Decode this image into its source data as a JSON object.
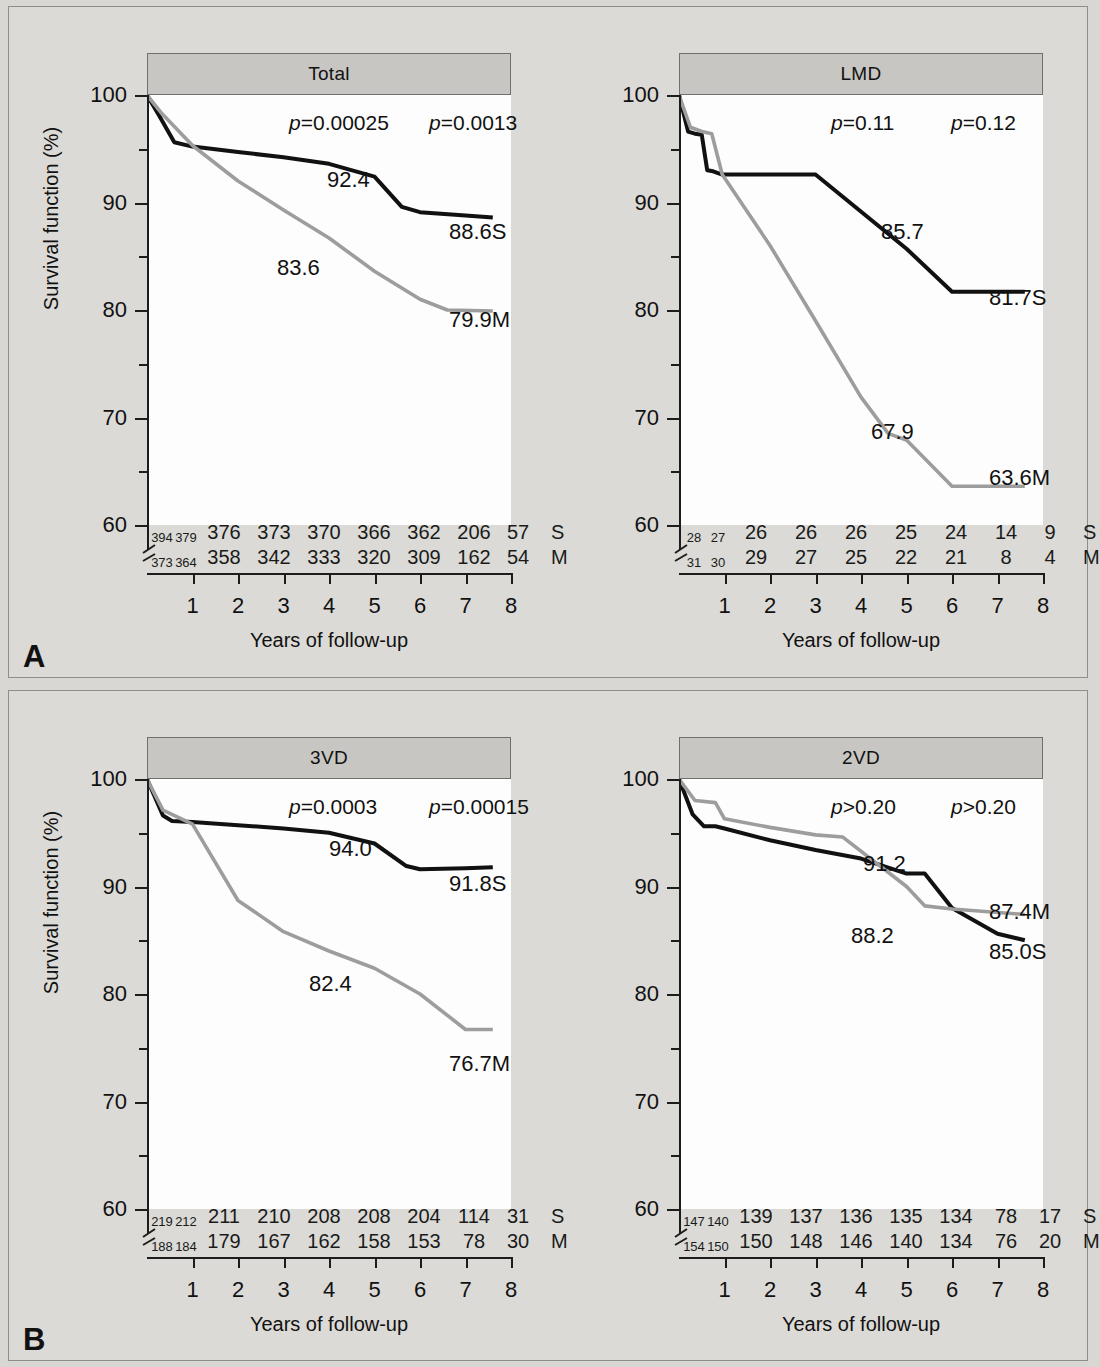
{
  "figure": {
    "panel_a_letter": "A",
    "panel_b_letter": "B",
    "y_title": "Survival function (%)",
    "x_title": "Years of follow-up",
    "y_ticks": [
      "100",
      "90",
      "80",
      "70",
      "60"
    ],
    "x_ticks": [
      "1",
      "2",
      "3",
      "4",
      "5",
      "6",
      "7",
      "8"
    ],
    "risk_tag_s": "S",
    "risk_tag_m": "M",
    "colors": {
      "surgery_line": "#111111",
      "medical_line": "#9d9d9d",
      "plot_background": "#fdfdfd",
      "figure_background": "#dbdad6",
      "header_strip": "#c7c6c2"
    }
  },
  "chart_data": [
    {
      "type": "line",
      "title": "Total",
      "panel": "A",
      "position": "left",
      "xlabel": "Years of follow-up",
      "ylabel": "Survival function (%)",
      "xlim": [
        0,
        8
      ],
      "ylim": [
        60,
        100
      ],
      "grid": false,
      "legend": "inline-end-labels",
      "annotations": {
        "p_left": "p=0.00025",
        "p_right": "p=0.0013",
        "surgery_mid_label": "92.4",
        "medical_mid_label": "83.6",
        "surgery_end_label": "88.6S",
        "medical_end_label": "79.9M"
      },
      "series": [
        {
          "name": "Surgery",
          "code": "S",
          "color": "#111111",
          "x": [
            0,
            0.25,
            0.6,
            1.0,
            2,
            3,
            4,
            5,
            5.6,
            6,
            7,
            7.6
          ],
          "y": [
            100,
            98.2,
            95.6,
            95.2,
            94.7,
            94.2,
            93.6,
            92.4,
            89.6,
            89.1,
            88.8,
            88.6
          ]
        },
        {
          "name": "Medical",
          "code": "M",
          "color": "#9d9d9d",
          "x": [
            0,
            0.3,
            1.0,
            2,
            3,
            4,
            5,
            6,
            6.6,
            7.6
          ],
          "y": [
            100,
            98.4,
            95.3,
            92.0,
            89.3,
            86.7,
            83.6,
            81.0,
            80.0,
            79.9
          ]
        }
      ],
      "risk_table": {
        "columns": [
          "0",
          "0.5",
          "1",
          "2",
          "3",
          "4",
          "5",
          "6",
          "7",
          "tag"
        ],
        "rows": [
          {
            "code": "S",
            "values": [
              "394",
              "379",
              "376",
              "373",
              "370",
              "366",
              "362",
              "206",
              "57"
            ]
          },
          {
            "code": "M",
            "values": [
              "373",
              "364",
              "358",
              "342",
              "333",
              "320",
              "309",
              "162",
              "54"
            ]
          }
        ]
      }
    },
    {
      "type": "line",
      "title": "LMD",
      "panel": "A",
      "position": "right",
      "xlabel": "Years of follow-up",
      "ylabel": "Survival function (%)",
      "xlim": [
        0,
        8
      ],
      "ylim": [
        60,
        100
      ],
      "grid": false,
      "legend": "inline-end-labels",
      "annotations": {
        "p_left": "p=0.11",
        "p_right": "p=0.12",
        "surgery_mid_label": "85.7",
        "medical_mid_label": "67.9",
        "surgery_end_label": "81.7S",
        "medical_end_label": "63.6M"
      },
      "series": [
        {
          "name": "Surgery",
          "code": "S",
          "color": "#111111",
          "x": [
            0,
            0.2,
            0.35,
            0.5,
            0.62,
            0.75,
            0.95,
            3,
            5,
            6,
            7.6
          ],
          "y": [
            100,
            96.6,
            96.4,
            96.3,
            93.0,
            92.9,
            92.6,
            92.6,
            85.7,
            81.7,
            81.7
          ]
        },
        {
          "name": "Medical",
          "code": "M",
          "color": "#9d9d9d",
          "x": [
            0,
            0.25,
            0.5,
            0.72,
            0.95,
            2,
            3,
            4,
            4.6,
            5,
            6,
            7.6
          ],
          "y": [
            100,
            97.0,
            96.6,
            96.4,
            92.6,
            86.0,
            79.0,
            71.9,
            68.5,
            67.9,
            63.6,
            63.6
          ]
        }
      ],
      "risk_table": {
        "columns": [
          "0",
          "0.5",
          "1",
          "2",
          "3",
          "4",
          "5",
          "6",
          "7",
          "tag"
        ],
        "rows": [
          {
            "code": "S",
            "values": [
              "28",
              "27",
              "26",
              "26",
              "26",
              "25",
              "24",
              "14",
              "9"
            ]
          },
          {
            "code": "M",
            "values": [
              "31",
              "30",
              "29",
              "27",
              "25",
              "22",
              "21",
              "8",
              "4"
            ]
          }
        ]
      }
    },
    {
      "type": "line",
      "title": "3VD",
      "panel": "B",
      "position": "left",
      "xlabel": "Years of follow-up",
      "ylabel": "Survival function (%)",
      "xlim": [
        0,
        8
      ],
      "ylim": [
        60,
        100
      ],
      "grid": false,
      "legend": "inline-end-labels",
      "annotations": {
        "p_left": "p=0.0003",
        "p_right": "p=0.00015",
        "surgery_mid_label": "94.0",
        "medical_mid_label": "82.4",
        "surgery_end_label": "91.8S",
        "medical_end_label": "76.7M"
      },
      "series": [
        {
          "name": "Surgery",
          "code": "S",
          "color": "#111111",
          "x": [
            0,
            0.35,
            0.55,
            1.0,
            2,
            3,
            4,
            5,
            5.7,
            6,
            7,
            7.6
          ],
          "y": [
            100,
            96.6,
            96.1,
            96.0,
            95.7,
            95.4,
            95.0,
            94.0,
            91.9,
            91.6,
            91.7,
            91.8
          ]
        },
        {
          "name": "Medical",
          "code": "M",
          "color": "#9d9d9d",
          "x": [
            0,
            0.35,
            1.0,
            2,
            3,
            4,
            5,
            6,
            7,
            7.6
          ],
          "y": [
            100,
            97.1,
            95.8,
            88.7,
            85.8,
            84.0,
            82.4,
            80.0,
            76.7,
            76.7
          ]
        }
      ],
      "risk_table": {
        "columns": [
          "0",
          "0.5",
          "1",
          "2",
          "3",
          "4",
          "5",
          "6",
          "7",
          "tag"
        ],
        "rows": [
          {
            "code": "S",
            "values": [
              "219",
              "212",
              "211",
              "210",
              "208",
              "208",
              "204",
              "114",
              "31"
            ]
          },
          {
            "code": "M",
            "values": [
              "188",
              "184",
              "179",
              "167",
              "162",
              "158",
              "153",
              "78",
              "30"
            ]
          }
        ]
      }
    },
    {
      "type": "line",
      "title": "2VD",
      "panel": "B",
      "position": "right",
      "xlabel": "Years of follow-up",
      "ylabel": "Survival function (%)",
      "xlim": [
        0,
        8
      ],
      "ylim": [
        60,
        100
      ],
      "grid": false,
      "legend": "inline-end-labels",
      "annotations": {
        "p_left": "p>0.20",
        "p_right": "p>0.20",
        "surgery_mid_label": "91.2",
        "medical_mid_label": "88.2",
        "surgery_end_label": "85.0S",
        "medical_end_label": "87.4M"
      },
      "series": [
        {
          "name": "Surgery",
          "code": "S",
          "color": "#111111",
          "x": [
            0,
            0.3,
            0.55,
            0.8,
            1.0,
            2,
            3,
            4,
            5,
            5.4,
            6,
            7,
            7.6
          ],
          "y": [
            100,
            96.7,
            95.6,
            95.6,
            95.4,
            94.3,
            93.4,
            92.6,
            91.2,
            91.2,
            88.0,
            85.6,
            85.0
          ]
        },
        {
          "name": "Medical",
          "code": "M",
          "color": "#9d9d9d",
          "x": [
            0,
            0.35,
            0.8,
            1.0,
            2,
            3,
            3.6,
            5,
            5.4,
            6,
            7.6
          ],
          "y": [
            100,
            98.0,
            97.8,
            96.3,
            95.5,
            94.8,
            94.6,
            90.0,
            88.2,
            87.9,
            87.4
          ]
        }
      ],
      "risk_table": {
        "columns": [
          "0",
          "0.5",
          "1",
          "2",
          "3",
          "4",
          "5",
          "6",
          "7",
          "tag"
        ],
        "rows": [
          {
            "code": "S",
            "values": [
              "147",
              "140",
              "139",
              "137",
              "136",
              "135",
              "134",
              "78",
              "17"
            ]
          },
          {
            "code": "M",
            "values": [
              "154",
              "150",
              "150",
              "148",
              "146",
              "140",
              "134",
              "76",
              "20"
            ]
          }
        ]
      }
    }
  ]
}
